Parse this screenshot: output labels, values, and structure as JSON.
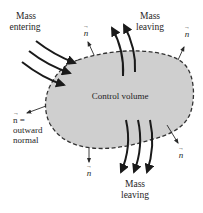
{
  "diagram": {
    "control_volume_label": "Control volume",
    "labels": {
      "mass_entering_line1": "Mass",
      "mass_entering_line2": "entering",
      "mass_leaving_top_line1": "Mass",
      "mass_leaving_top_line2": "leaving",
      "mass_leaving_bottom_line1": "Mass",
      "mass_leaving_bottom_line2": "leaving",
      "normal_symbol": "n",
      "normal_eq": "n =",
      "outward": "outward",
      "normal": "normal",
      "vector_arrow": "→"
    },
    "colors": {
      "fill": "#cfcfcf",
      "boundary": "#333333",
      "arrows": "#1a1a1a",
      "text": "#1e1e1e"
    }
  }
}
